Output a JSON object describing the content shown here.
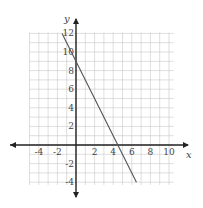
{
  "chart_data": {
    "type": "line",
    "title": "",
    "xlabel": "x",
    "ylabel": "y",
    "xlim": [
      -6,
      12
    ],
    "ylim": [
      -4,
      12
    ],
    "grid": true,
    "x_ticks": [
      -4,
      -2,
      2,
      4,
      6,
      8,
      10
    ],
    "y_ticks": [
      -4,
      -2,
      2,
      4,
      6,
      8,
      10,
      12
    ],
    "x_tick_labels": [
      "-4",
      "-2",
      "2",
      "4",
      "6",
      "8",
      "10"
    ],
    "y_tick_labels": [
      "-4",
      "-2",
      "2",
      "4",
      "6",
      "8",
      "10",
      "12"
    ],
    "series": [
      {
        "name": "line",
        "equation": "y = -2x + 9",
        "x": [
          -1.5,
          6.5
        ],
        "y": [
          12,
          -4
        ]
      }
    ],
    "colors": {
      "grid": "#c8c8c8",
      "axis": "#222222",
      "line": "#555555"
    }
  }
}
